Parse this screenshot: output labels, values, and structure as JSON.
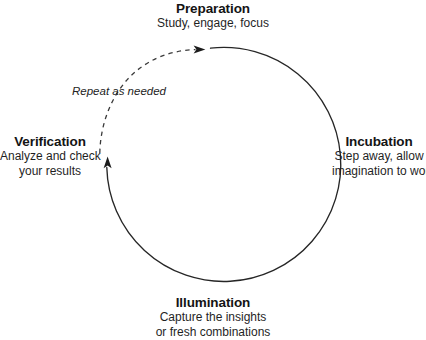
{
  "diagram": {
    "type": "cycle",
    "background_color": "#ffffff",
    "stroke_color": "#262626",
    "text_color": "#141414",
    "geometry": {
      "center_x": 215,
      "center_y": 165,
      "radius": 117
    },
    "stages": [
      {
        "id": "preparation",
        "position": "top",
        "title": "Preparation",
        "description_lines": [
          "Study, engage, focus"
        ]
      },
      {
        "id": "incubation",
        "position": "right",
        "title": "Incubation",
        "description_lines": [
          "Step away, allow",
          "imagination to work"
        ]
      },
      {
        "id": "illumination",
        "position": "bottom",
        "title": "Illumination",
        "description_lines": [
          "Capture the insights",
          "or fresh combinations"
        ]
      },
      {
        "id": "verification",
        "position": "left",
        "title": "Verification",
        "description_lines": [
          "Analyze and check",
          "your results"
        ]
      }
    ],
    "annotation": {
      "id": "repeat-as-needed",
      "text": "Repeat as needed",
      "style": "italic",
      "attached_to": "dashed-return-arc"
    },
    "arcs": [
      {
        "id": "main-cycle-arc",
        "style": "solid",
        "direction": "clockwise",
        "from": "preparation",
        "to": "verification",
        "arrowhead": "at-end-pointing-up"
      },
      {
        "id": "dashed-return-arc",
        "style": "dashed",
        "direction": "clockwise",
        "from": "verification",
        "to": "preparation",
        "arrowhead": "at-end-pointing-right"
      }
    ]
  }
}
